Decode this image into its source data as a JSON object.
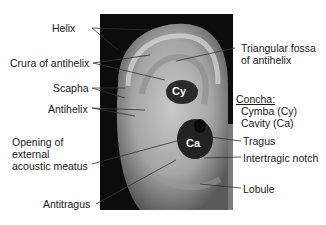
{
  "figure": {
    "photo_regions": {
      "cymba": "Cy",
      "cavity": "Ca"
    },
    "labels_left": [
      {
        "id": "helix",
        "text": "Helix"
      },
      {
        "id": "crura",
        "text": "Crura of antihelix"
      },
      {
        "id": "scapha",
        "text": "Scapha"
      },
      {
        "id": "antihelix",
        "text": "Antihelix"
      },
      {
        "id": "opening",
        "lines": [
          "Opening of",
          "external",
          "acoustic meatus"
        ]
      },
      {
        "id": "antitragus",
        "text": "Antitragus"
      }
    ],
    "labels_right": [
      {
        "id": "triangular",
        "lines": [
          "Triangular fossa",
          "of antihelix"
        ]
      },
      {
        "id": "concha",
        "title": "Concha:",
        "lines": [
          "Cymba (Cy)",
          "Cavity (Ca)"
        ]
      },
      {
        "id": "tragus",
        "text": "Tragus"
      },
      {
        "id": "intertragic",
        "text": "Intertragic notch"
      },
      {
        "id": "lobule",
        "text": "Lobule"
      }
    ]
  }
}
